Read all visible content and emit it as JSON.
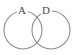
{
  "figure": {
    "type": "venn-diagram",
    "background_color": "#fefefe",
    "stroke_color": "#8a8a8a",
    "label_color": "#4a4a4a",
    "width": 75,
    "height": 55
  },
  "sets": [
    {
      "id": "set-a",
      "label": "A",
      "position": "left",
      "center_x": 23,
      "center_y": 30,
      "radius": 19,
      "label_x": 22,
      "label_y": 11
    },
    {
      "id": "set-d",
      "label": "D",
      "position": "right",
      "center_x": 51,
      "center_y": 30,
      "radius": 19,
      "label_x": 46,
      "label_y": 11
    }
  ],
  "intersection": {
    "label": "",
    "top_crossing_x": 37,
    "top_crossing_y": 13,
    "bottom_crossing_x": 37,
    "bottom_crossing_y": 47
  }
}
